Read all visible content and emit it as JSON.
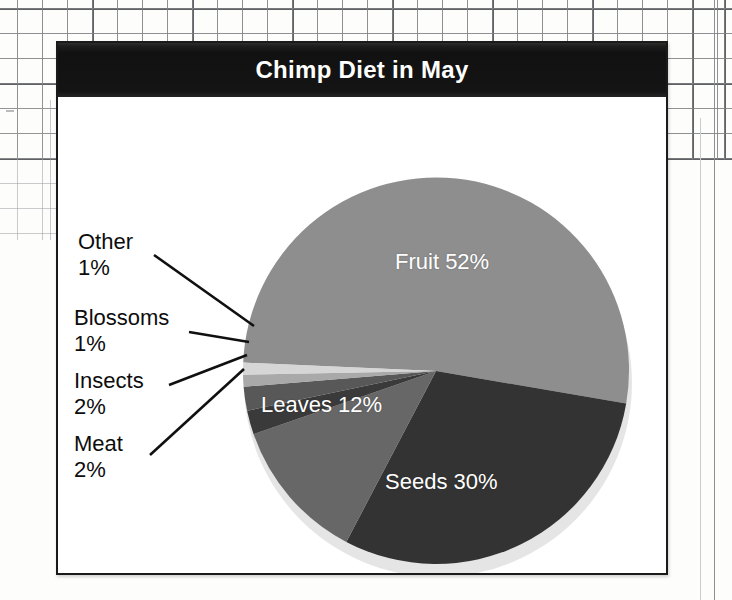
{
  "chart_panel": {
    "title": "Chimp Diet in May"
  },
  "chart_data": {
    "type": "pie",
    "title": "Chimp Diet in May",
    "xlabel": "",
    "ylabel": "",
    "legend_position": "none",
    "grid": false,
    "categories": [
      "Fruit",
      "Seeds",
      "Leaves",
      "Meat",
      "Insects",
      "Blossoms",
      "Other"
    ],
    "values": [
      52,
      30,
      12,
      2,
      2,
      1,
      1
    ],
    "unit": "%",
    "slices": [
      {
        "label": "Fruit",
        "value": 52,
        "display": "52%",
        "color": "#8e8e8e",
        "label_placement": "inside",
        "text_color": "#ffffff"
      },
      {
        "label": "Seeds",
        "value": 30,
        "display": "30%",
        "color": "#333333",
        "label_placement": "inside",
        "text_color": "#ffffff"
      },
      {
        "label": "Leaves",
        "value": 12,
        "display": "12%",
        "color": "#676767",
        "label_placement": "inside",
        "text_color": "#ffffff"
      },
      {
        "label": "Meat",
        "value": 2,
        "display": "2%",
        "color": "#3a3a3a",
        "label_placement": "callout",
        "text_color": "#0d0d0d"
      },
      {
        "label": "Insects",
        "value": 2,
        "display": "2%",
        "color": "#585858",
        "label_placement": "callout",
        "text_color": "#0d0d0d"
      },
      {
        "label": "Blossoms",
        "value": 1,
        "display": "1%",
        "color": "#a9a9a9",
        "label_placement": "callout",
        "text_color": "#0d0d0d"
      },
      {
        "label": "Other",
        "value": 1,
        "display": "1%",
        "color": "#d6d6d6",
        "label_placement": "callout",
        "text_color": "#0d0d0d"
      }
    ]
  },
  "labels": {
    "fruit": {
      "name": "Fruit",
      "pct": "52%"
    },
    "seeds": {
      "name": "Seeds",
      "pct": "30%"
    },
    "leaves": {
      "name": "Leaves",
      "pct": "12%"
    },
    "meat": {
      "name": "Meat",
      "pct": "2%"
    },
    "insects": {
      "name": "Insects",
      "pct": "2%"
    },
    "blossoms": {
      "name": "Blossoms",
      "pct": "1%"
    },
    "other": {
      "name": "Other",
      "pct": "1%"
    }
  },
  "colors": {
    "title_bar": "#121212",
    "title_text": "#ffffff",
    "panel_bg": "#ffffff",
    "panel_border": "#1a1a1a",
    "grid_line": "#6e7073",
    "fruit": "#8e8e8e",
    "seeds": "#333333",
    "leaves": "#676767",
    "meat": "#3a3a3a",
    "insects": "#585858",
    "blossoms": "#a9a9a9",
    "other": "#d6d6d6"
  }
}
